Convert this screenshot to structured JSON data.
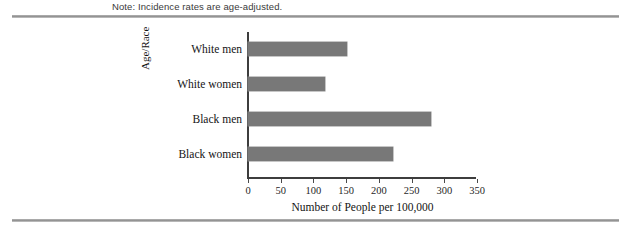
{
  "note": {
    "text": "Note: Incidence rates are age-adjusted."
  },
  "colors": {
    "bar_fill": "#787878",
    "axis": "#3d3d3d",
    "rule": "#8e8e8e",
    "background": "#ffffff",
    "text": "#141414"
  },
  "chart_data": {
    "type": "bar",
    "orientation": "horizontal",
    "title": "",
    "subtitle": "",
    "categories": [
      "White men",
      "White women",
      "Black men",
      "Black women"
    ],
    "values": [
      152,
      118,
      279,
      222
    ],
    "series": [
      {
        "name": "Incidence rate",
        "values": [
          152,
          118,
          279,
          222
        ]
      }
    ],
    "xlabel": "Number of People per 100,000",
    "ylabel": "Age/Race",
    "xlim": [
      0,
      350
    ],
    "xticks": [
      0,
      50,
      100,
      150,
      200,
      250,
      300,
      350
    ],
    "xtick_labels": [
      "0",
      "50",
      "100",
      "150",
      "200",
      "250",
      "300",
      "350"
    ],
    "grid": false,
    "legend": false,
    "legend_position": "none",
    "annotations": [
      "Note: Incidence rates are age-adjusted."
    ]
  }
}
